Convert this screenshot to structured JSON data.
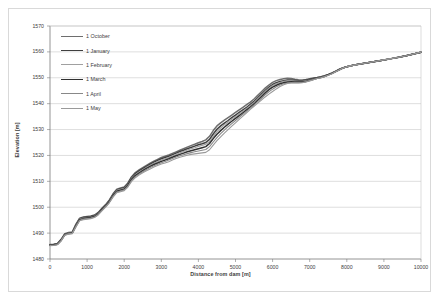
{
  "chart_data": {
    "type": "line",
    "title": "",
    "xlabel": "Distance from dam [m]",
    "ylabel": "Elevation [m]",
    "xlim": [
      0,
      10000
    ],
    "ylim": [
      1480,
      1570
    ],
    "xticks": [
      "0",
      "1000",
      "2000",
      "3000",
      "4000",
      "5000",
      "6000",
      "7000",
      "8000",
      "9000",
      "10000"
    ],
    "yticks": [
      "1480",
      "1490",
      "1500",
      "1510",
      "1520",
      "1530",
      "1540",
      "1550",
      "1560",
      "1570"
    ],
    "grid": "horizontal",
    "legend_position": "inside-top-left",
    "x": [
      0,
      100,
      200,
      300,
      400,
      500,
      600,
      700,
      800,
      900,
      1000,
      1100,
      1200,
      1300,
      1400,
      1500,
      1600,
      1700,
      1800,
      1900,
      2000,
      2100,
      2200,
      2300,
      2400,
      2500,
      2600,
      2700,
      2800,
      2900,
      3000,
      3100,
      3200,
      3300,
      3400,
      3500,
      3600,
      3700,
      3800,
      3900,
      4000,
      4100,
      4200,
      4300,
      4400,
      4500,
      4600,
      4700,
      4800,
      4900,
      5000,
      5100,
      5200,
      5300,
      5400,
      5500,
      5600,
      5700,
      5800,
      5900,
      6000,
      6100,
      6200,
      6300,
      6400,
      6500,
      6600,
      6700,
      6800,
      6900,
      7000,
      7100,
      7200,
      7300,
      7400,
      7500,
      7600,
      7700,
      7800,
      7900,
      8000,
      8200,
      8400,
      8600,
      8800,
      9000,
      9200,
      9400,
      9600,
      9800,
      10000
    ],
    "series": [
      {
        "name": "1 October",
        "color": "#6e6e6e",
        "width": 1.5,
        "values": [
          1485.6,
          1485.7,
          1486.0,
          1487.6,
          1489.8,
          1490.2,
          1490.4,
          1493.5,
          1495.8,
          1496.2,
          1496.4,
          1496.6,
          1497.0,
          1498.0,
          1499.6,
          1501.0,
          1502.8,
          1505.2,
          1507.0,
          1507.4,
          1507.8,
          1509.4,
          1511.8,
          1513.4,
          1514.4,
          1515.3,
          1516.2,
          1517.0,
          1517.8,
          1518.5,
          1519.2,
          1519.7,
          1520.2,
          1520.8,
          1521.4,
          1522.0,
          1522.6,
          1523.2,
          1523.8,
          1524.3,
          1524.9,
          1525.4,
          1526.0,
          1527.4,
          1529.6,
          1531.4,
          1532.6,
          1533.6,
          1534.6,
          1535.6,
          1536.6,
          1537.6,
          1538.6,
          1539.6,
          1540.6,
          1541.8,
          1543.2,
          1544.6,
          1546.0,
          1547.2,
          1548.2,
          1548.9,
          1549.3,
          1549.6,
          1549.8,
          1549.7,
          1549.4,
          1549.2,
          1549.1,
          1549.3,
          1549.6,
          1549.9,
          1550.1,
          1550.4,
          1550.8,
          1551.3,
          1551.9,
          1552.6,
          1553.3,
          1553.9,
          1554.3,
          1554.9,
          1555.4,
          1555.9,
          1556.4,
          1556.9,
          1557.4,
          1557.9,
          1558.5,
          1559.2,
          1559.9
        ]
      },
      {
        "name": "1 January",
        "color": "#3f3f3f",
        "width": 1.5,
        "values": [
          1485.5,
          1485.6,
          1485.9,
          1487.4,
          1489.6,
          1490.0,
          1490.2,
          1493.2,
          1495.6,
          1496.0,
          1496.2,
          1496.4,
          1496.8,
          1497.8,
          1499.4,
          1500.8,
          1502.5,
          1504.9,
          1506.7,
          1507.1,
          1507.5,
          1509.1,
          1511.5,
          1513.0,
          1514.0,
          1514.9,
          1515.8,
          1516.6,
          1517.4,
          1518.1,
          1518.7,
          1519.2,
          1519.7,
          1520.3,
          1520.9,
          1521.5,
          1522.0,
          1522.6,
          1523.1,
          1523.6,
          1524.1,
          1524.5,
          1525.0,
          1526.2,
          1528.3,
          1530.1,
          1531.4,
          1532.5,
          1533.5,
          1534.6,
          1535.6,
          1536.6,
          1537.6,
          1538.6,
          1539.7,
          1540.9,
          1542.3,
          1543.7,
          1545.1,
          1546.4,
          1547.4,
          1548.1,
          1548.6,
          1548.9,
          1549.1,
          1549.1,
          1549.0,
          1548.9,
          1548.9,
          1549.1,
          1549.4,
          1549.7,
          1550.0,
          1550.3,
          1550.7,
          1551.2,
          1551.8,
          1552.5,
          1553.2,
          1553.8,
          1554.3,
          1554.9,
          1555.4,
          1555.9,
          1556.4,
          1556.9,
          1557.4,
          1557.9,
          1558.5,
          1559.2,
          1559.9
        ]
      },
      {
        "name": "1 February",
        "color": "#a0a0a0",
        "width": 1.1,
        "values": [
          1485.4,
          1485.5,
          1485.8,
          1487.3,
          1489.5,
          1489.9,
          1490.1,
          1493.0,
          1495.4,
          1495.8,
          1496.0,
          1496.2,
          1496.6,
          1497.6,
          1499.2,
          1500.6,
          1502.3,
          1504.7,
          1506.5,
          1506.9,
          1507.3,
          1508.8,
          1511.2,
          1512.6,
          1513.6,
          1514.5,
          1515.4,
          1516.2,
          1517.0,
          1517.6,
          1518.2,
          1518.7,
          1519.2,
          1519.8,
          1520.4,
          1521.0,
          1521.5,
          1522.1,
          1522.6,
          1523.0,
          1523.5,
          1523.9,
          1524.3,
          1525.3,
          1527.3,
          1529.2,
          1530.6,
          1531.8,
          1532.9,
          1534.0,
          1535.0,
          1536.1,
          1537.1,
          1538.2,
          1539.3,
          1540.5,
          1541.9,
          1543.3,
          1544.7,
          1546.0,
          1547.0,
          1547.7,
          1548.2,
          1548.6,
          1548.8,
          1548.8,
          1548.7,
          1548.6,
          1548.6,
          1548.8,
          1549.1,
          1549.5,
          1549.9,
          1550.2,
          1550.6,
          1551.1,
          1551.7,
          1552.4,
          1553.1,
          1553.8,
          1554.3,
          1554.9,
          1555.4,
          1555.9,
          1556.4,
          1556.9,
          1557.4,
          1557.9,
          1558.5,
          1559.2,
          1559.9
        ]
      },
      {
        "name": "1 March",
        "color": "#303030",
        "width": 1.5,
        "values": [
          1485.3,
          1485.4,
          1485.7,
          1487.2,
          1489.4,
          1489.8,
          1490.0,
          1492.8,
          1495.2,
          1495.6,
          1495.8,
          1496.0,
          1496.4,
          1497.4,
          1499.0,
          1500.4,
          1502.1,
          1504.5,
          1506.2,
          1506.6,
          1507.0,
          1508.5,
          1510.8,
          1512.2,
          1513.2,
          1514.1,
          1515.0,
          1515.8,
          1516.5,
          1517.1,
          1517.7,
          1518.2,
          1518.7,
          1519.3,
          1519.9,
          1520.4,
          1520.9,
          1521.4,
          1521.8,
          1522.2,
          1522.6,
          1523.0,
          1523.4,
          1524.6,
          1526.5,
          1528.2,
          1529.6,
          1530.9,
          1532.1,
          1533.2,
          1534.3,
          1535.4,
          1536.5,
          1537.6,
          1538.7,
          1539.9,
          1541.3,
          1542.7,
          1544.1,
          1545.4,
          1546.4,
          1547.1,
          1547.7,
          1548.1,
          1548.4,
          1548.5,
          1548.4,
          1548.4,
          1548.4,
          1548.6,
          1549.0,
          1549.4,
          1549.8,
          1550.1,
          1550.5,
          1551.1,
          1551.7,
          1552.4,
          1553.1,
          1553.8,
          1554.3,
          1554.9,
          1555.4,
          1555.9,
          1556.4,
          1556.9,
          1557.4,
          1557.9,
          1558.5,
          1559.2,
          1559.9
        ]
      },
      {
        "name": "1 April",
        "color": "#888888",
        "width": 1.1,
        "values": [
          1485.2,
          1485.3,
          1485.6,
          1487.1,
          1489.3,
          1489.7,
          1489.9,
          1492.6,
          1495.0,
          1495.4,
          1495.6,
          1495.8,
          1496.2,
          1497.2,
          1498.8,
          1500.2,
          1501.9,
          1504.2,
          1505.9,
          1506.3,
          1506.7,
          1508.1,
          1510.4,
          1511.8,
          1512.8,
          1513.7,
          1514.6,
          1515.3,
          1516.0,
          1516.6,
          1517.2,
          1517.7,
          1518.2,
          1518.8,
          1519.4,
          1519.9,
          1520.3,
          1520.7,
          1521.1,
          1521.4,
          1521.7,
          1522.0,
          1522.3,
          1523.4,
          1525.2,
          1526.9,
          1528.4,
          1529.8,
          1531.1,
          1532.3,
          1533.5,
          1534.7,
          1535.9,
          1537.1,
          1538.3,
          1539.5,
          1540.8,
          1542.1,
          1543.4,
          1544.6,
          1545.6,
          1546.5,
          1547.2,
          1547.7,
          1548.0,
          1548.1,
          1548.1,
          1548.1,
          1548.2,
          1548.5,
          1548.9,
          1549.3,
          1549.7,
          1550.0,
          1550.5,
          1551.0,
          1551.6,
          1552.3,
          1553.1,
          1553.8,
          1554.3,
          1554.9,
          1555.4,
          1555.9,
          1556.4,
          1556.9,
          1557.4,
          1557.9,
          1558.5,
          1559.2,
          1559.9
        ]
      },
      {
        "name": "1 May",
        "color": "#9a9a9a",
        "width": 1.1,
        "values": [
          1485.1,
          1485.2,
          1485.5,
          1487.0,
          1489.2,
          1489.6,
          1489.8,
          1492.4,
          1494.8,
          1495.2,
          1495.4,
          1495.6,
          1496.0,
          1497.0,
          1498.6,
          1500.0,
          1501.7,
          1503.9,
          1505.6,
          1506.0,
          1506.4,
          1507.8,
          1510.0,
          1511.4,
          1512.4,
          1513.3,
          1514.1,
          1514.8,
          1515.5,
          1516.1,
          1516.7,
          1517.1,
          1517.6,
          1518.2,
          1518.8,
          1519.3,
          1519.7,
          1520.1,
          1520.4,
          1520.6,
          1520.8,
          1521.0,
          1521.2,
          1522.2,
          1524.0,
          1525.7,
          1527.2,
          1528.6,
          1530.0,
          1531.3,
          1532.6,
          1533.9,
          1535.2,
          1536.5,
          1537.8,
          1539.0,
          1540.2,
          1541.4,
          1542.6,
          1543.7,
          1544.7,
          1545.7,
          1546.6,
          1547.3,
          1547.8,
          1548.0,
          1548.0,
          1548.0,
          1548.1,
          1548.4,
          1548.8,
          1549.2,
          1549.7,
          1550.0,
          1550.4,
          1551.0,
          1551.6,
          1552.3,
          1553.0,
          1553.8,
          1554.3,
          1554.9,
          1555.4,
          1555.9,
          1556.4,
          1556.9,
          1557.4,
          1557.9,
          1558.5,
          1559.2,
          1559.9
        ]
      }
    ]
  }
}
